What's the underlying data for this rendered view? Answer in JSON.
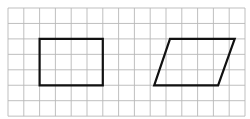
{
  "diagram": {
    "grid": {
      "x0": 8,
      "y0": 8,
      "cols": 15,
      "rows": 7,
      "cell_w": 15.8,
      "cell_h": 15.45,
      "line_color": "#b8b8b8",
      "line_width": 0.9
    },
    "shapes": [
      {
        "name": "rectangle",
        "type": "rectangle",
        "grid_points": [
          [
            2,
            2
          ],
          [
            6,
            2
          ],
          [
            6,
            5
          ],
          [
            2,
            5
          ]
        ],
        "stroke": "#111111",
        "stroke_width": 2.2
      },
      {
        "name": "parallelogram",
        "type": "parallelogram",
        "grid_points": [
          [
            10.25,
            2
          ],
          [
            14.35,
            2
          ],
          [
            13.3,
            5
          ],
          [
            9.25,
            5
          ]
        ],
        "stroke": "#111111",
        "stroke_width": 2.2
      }
    ]
  }
}
